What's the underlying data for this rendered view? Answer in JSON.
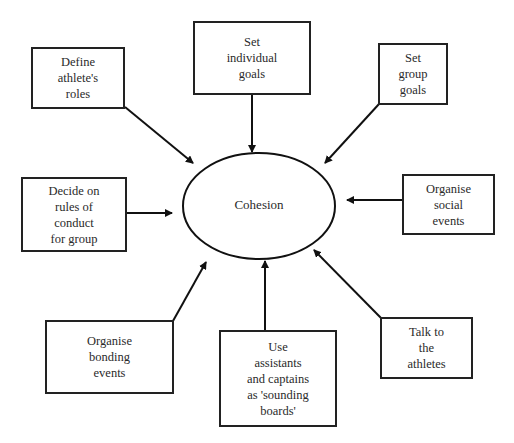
{
  "diagram": {
    "center": {
      "label": "Cohesion"
    },
    "boxes": [
      {
        "id": "define-roles",
        "label": "Define\nathlete's\nroles"
      },
      {
        "id": "individual-goals",
        "label": "Set\nindividual\ngoals"
      },
      {
        "id": "group-goals",
        "label": "Set\ngroup\ngoals"
      },
      {
        "id": "rules-of-conduct",
        "label": "Decide on\nrules of\nconduct\nfor group"
      },
      {
        "id": "social-events",
        "label": "Organise\nsocial\nevents"
      },
      {
        "id": "bonding-events",
        "label": "Organise\nbonding\nevents"
      },
      {
        "id": "sounding-boards",
        "label": "Use\nassistants\nand captains\nas 'sounding\nboards'"
      },
      {
        "id": "talk-to-athletes",
        "label": "Talk to\nthe\nathletes"
      }
    ],
    "caption": {
      "text": "",
      "note": "A partially clipped caption line sits at the bottom edge; its text could not be verified from the screenshot."
    }
  }
}
